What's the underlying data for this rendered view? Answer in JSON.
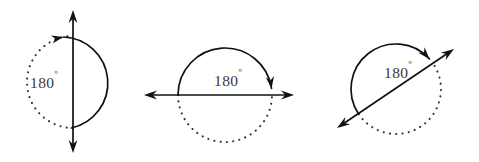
{
  "figure": {
    "background_color": "#ffffff",
    "stroke_color": "#111111",
    "dotted_color": "#333333",
    "label_color": "#3a3a3a",
    "panel_count": 3
  },
  "panels": [
    {
      "id": "panel-vertical",
      "name": "vertical-axis-180-rotation",
      "label": "180",
      "degree_symbol": "º",
      "label_full": "180º",
      "label_x": 44,
      "label_y": 88,
      "axis": {
        "orientation": "vertical",
        "x1": 73,
        "y1": 10,
        "x2": 73,
        "y2": 153,
        "arrow_start": true,
        "arrow_end": true
      },
      "circle": {
        "cx": 73,
        "cy": 82,
        "r": 46
      },
      "dotted_arc": {
        "start_deg": -90,
        "end_deg": 90,
        "side": "right"
      },
      "solid_arc": {
        "start_deg": 90,
        "end_deg": 265,
        "direction": "counterclockwise",
        "arrow_at": "end",
        "side": "left"
      }
    },
    {
      "id": "panel-horizontal",
      "name": "horizontal-axis-180-rotation",
      "label": "180",
      "degree_symbol": "º",
      "label_full": "180º",
      "label_x": 228,
      "label_y": 86,
      "axis": {
        "orientation": "horizontal",
        "x1": 144,
        "y1": 95,
        "x2": 294,
        "y2": 95,
        "arrow_start": true,
        "arrow_end": true
      },
      "circle": {
        "cx": 225,
        "cy": 95,
        "r": 47
      },
      "dotted_arc": {
        "start_deg": 0,
        "end_deg": 180,
        "side": "bottom"
      },
      "solid_arc": {
        "start_deg": 180,
        "end_deg": 352,
        "direction": "clockwise",
        "arrow_at": "end",
        "side": "top"
      }
    },
    {
      "id": "panel-diagonal",
      "name": "diagonal-axis-180-rotation",
      "label": "180",
      "degree_symbol": "º",
      "label_full": "180º",
      "label_x": 398,
      "label_y": 78,
      "axis": {
        "orientation": "diagonal",
        "x1": 337,
        "y1": 128,
        "x2": 454,
        "y2": 49,
        "angle_deg": -34,
        "arrow_start": true,
        "arrow_end": true
      },
      "circle": {
        "cx": 396,
        "cy": 89,
        "r": 45
      },
      "dotted_arc": {
        "start_deg": -34,
        "end_deg": 146,
        "side": "lower-right"
      },
      "solid_arc": {
        "start_deg": 146,
        "end_deg": 318,
        "direction": "clockwise",
        "arrow_at": "end",
        "side": "upper-left"
      }
    }
  ]
}
